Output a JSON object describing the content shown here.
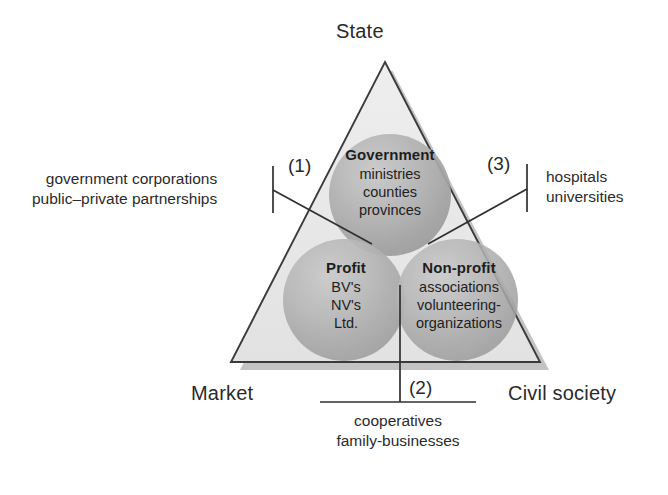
{
  "figure": {
    "type": "venn-in-triangle",
    "background_color": "#ffffff",
    "triangle_fill": "#e8e8e8",
    "triangle_stroke": "#3a3a3a",
    "circle_fill": "#a9a9a9",
    "shadow_color": "#b5b5b5",
    "line_color": "#2f2f2f",
    "text_color": "#1e1e1e"
  },
  "corners": {
    "top": "State",
    "bottom_left": "Market",
    "bottom_right": "Civil society"
  },
  "circles": [
    {
      "id": "government",
      "title": "Government",
      "items": [
        "ministries",
        "counties",
        "provinces"
      ],
      "cx": 390,
      "cy": 195,
      "r": 61
    },
    {
      "id": "profit",
      "title": "Profit",
      "items": [
        "BV's",
        "NV's",
        "Ltd."
      ],
      "cx": 344,
      "cy": 300,
      "r": 61
    },
    {
      "id": "nonprofit",
      "title": "Non-profit",
      "items": [
        "associations",
        "volunteering-",
        "organizations"
      ],
      "cx": 457,
      "cy": 300,
      "r": 61
    }
  ],
  "callouts": [
    {
      "id": "overlap-1",
      "marker": "(1)",
      "lines": [
        "government corporations",
        "public–private partnerships"
      ],
      "side": "left",
      "describes": "Government ∩ Profit"
    },
    {
      "id": "overlap-2",
      "marker": "(2)",
      "lines": [
        "cooperatives",
        "family-businesses"
      ],
      "side": "bottom",
      "describes": "Profit ∩ Non-profit"
    },
    {
      "id": "overlap-3",
      "marker": "(3)",
      "lines": [
        "hospitals",
        "universities"
      ],
      "side": "right",
      "describes": "Government ∩ Non-profit"
    }
  ]
}
